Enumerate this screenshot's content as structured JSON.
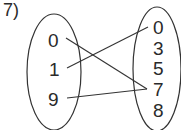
{
  "problem_label": "7)",
  "domain_set": [
    "0",
    "1",
    "9"
  ],
  "range_set": [
    "0",
    "3",
    "5",
    "7",
    "8"
  ],
  "mappings": [
    {
      "from": "0",
      "to": "7"
    },
    {
      "from": "1",
      "to": "0"
    },
    {
      "from": "9",
      "to": "7"
    }
  ]
}
